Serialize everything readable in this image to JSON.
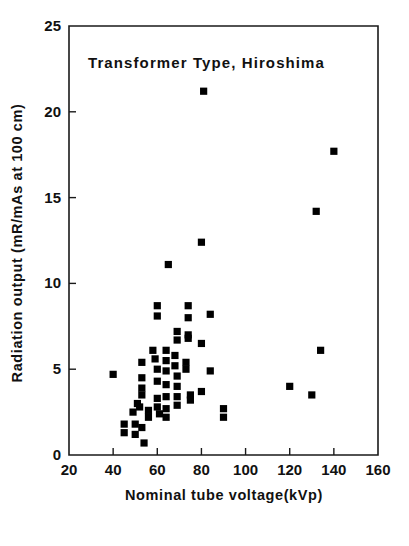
{
  "chart_data": {
    "type": "scatter",
    "title": "Transformer Type, Hiroshima",
    "xlabel": "Nominal tube voltage(kVp)",
    "ylabel": "Radiation output (mR/mAs at 100 cm)",
    "xlim": [
      20,
      160
    ],
    "ylim": [
      0,
      25
    ],
    "xticks": [
      20,
      40,
      60,
      80,
      100,
      120,
      140,
      160
    ],
    "yticks": [
      0,
      5,
      10,
      15,
      20,
      25
    ],
    "xtick_labels": [
      "20",
      "40",
      "60",
      "80",
      "100",
      "120",
      "140",
      "160"
    ],
    "ytick_labels": [
      "0",
      "5",
      "10",
      "15",
      "20",
      "25"
    ],
    "grid": false,
    "legend": null,
    "marker_style": "filled-square",
    "marker_color": "#000000",
    "series": [
      {
        "name": "Transformer type units (Hiroshima)",
        "points": [
          [
            40,
            4.7
          ],
          [
            45,
            1.8
          ],
          [
            45,
            1.3
          ],
          [
            49,
            2.5
          ],
          [
            50,
            1.8
          ],
          [
            50,
            1.2
          ],
          [
            51,
            3.0
          ],
          [
            52,
            2.8
          ],
          [
            53,
            5.4
          ],
          [
            53,
            4.5
          ],
          [
            53,
            3.9
          ],
          [
            53,
            3.5
          ],
          [
            53,
            1.6
          ],
          [
            54,
            0.7
          ],
          [
            56,
            2.6
          ],
          [
            56,
            2.2
          ],
          [
            58,
            6.1
          ],
          [
            59,
            5.6
          ],
          [
            60,
            8.7
          ],
          [
            60,
            8.1
          ],
          [
            60,
            5.0
          ],
          [
            60,
            4.3
          ],
          [
            60,
            3.3
          ],
          [
            60,
            2.8
          ],
          [
            61,
            2.4
          ],
          [
            64,
            6.1
          ],
          [
            64,
            5.5
          ],
          [
            64,
            4.9
          ],
          [
            64,
            4.1
          ],
          [
            64,
            3.4
          ],
          [
            64,
            2.7
          ],
          [
            64,
            2.2
          ],
          [
            65,
            11.1
          ],
          [
            68,
            5.8
          ],
          [
            68,
            5.2
          ],
          [
            69,
            7.2
          ],
          [
            69,
            6.7
          ],
          [
            69,
            4.6
          ],
          [
            69,
            4.0
          ],
          [
            69,
            3.4
          ],
          [
            69,
            2.9
          ],
          [
            73,
            5.4
          ],
          [
            73,
            5.0
          ],
          [
            74,
            8.7
          ],
          [
            74,
            8.0
          ],
          [
            74,
            7.0
          ],
          [
            74,
            6.8
          ],
          [
            75,
            3.5
          ],
          [
            75,
            3.2
          ],
          [
            80,
            12.4
          ],
          [
            80,
            6.5
          ],
          [
            80,
            3.7
          ],
          [
            81,
            21.2
          ],
          [
            84,
            8.2
          ],
          [
            84,
            4.9
          ],
          [
            90,
            2.7
          ],
          [
            90,
            2.2
          ],
          [
            120,
            4.0
          ],
          [
            130,
            3.5
          ],
          [
            134,
            6.1
          ],
          [
            132,
            14.2
          ],
          [
            140,
            17.7
          ]
        ]
      }
    ]
  },
  "axes": {
    "title_text": "Transformer Type, Hiroshima",
    "x_axis_title": "Nominal tube voltage(kVp)",
    "y_axis_title": "Radiation output (mR/mAs at 100 cm)"
  }
}
